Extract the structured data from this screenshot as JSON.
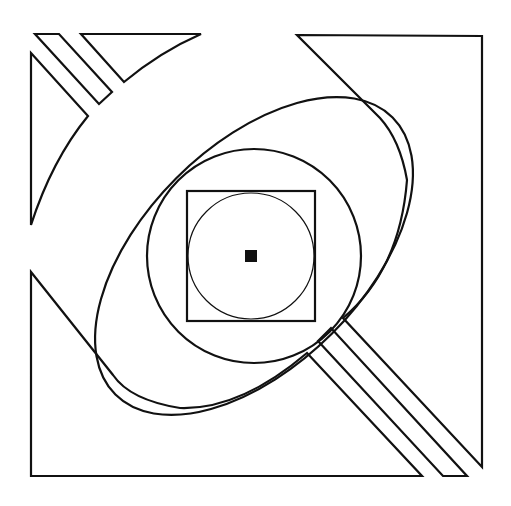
{
  "figure": {
    "width": 511,
    "height": 506,
    "background": "#ffffff",
    "stroke_color": "#111111",
    "stroke_width": 2.2,
    "thin_stroke_width": 1.2
  },
  "shapes": {
    "top_left_triangle_left": "M31,53 L88,116 Q52,160 31,225 Z",
    "top_left_strip": "M35,34 L59,34 L112,92 L99,104 Z",
    "top_left_triangle_top": "M81,34 L201,34 Q160,52 124,82 Z",
    "top_right_corner": "M297,35 L482,36 L482,467 L343,318 Q400,270 407,180 Q400,140 380,118 Z",
    "bottom_left_corner": "M31,272 L31,476 L422,476 L307,353 Q240,410 180,408 Q130,400 113,375 L31,272 Z",
    "bottom_right_strip": "M318,341 L331,328 L467,476 L443,476 Z",
    "big_ellipse": {
      "cx": 254,
      "cy": 256,
      "rx": 196,
      "ry": 110,
      "rotate": -45
    },
    "middle_circle": {
      "cx": 254,
      "cy": 256,
      "r": 107
    },
    "inner_square": {
      "x": 187,
      "y": 191,
      "width": 128,
      "height": 130
    },
    "inner_circle": {
      "cx": 251,
      "cy": 256,
      "r": 63
    },
    "center_dot": {
      "x": 245,
      "y": 250,
      "width": 12,
      "height": 12,
      "fill": "#111111"
    }
  }
}
